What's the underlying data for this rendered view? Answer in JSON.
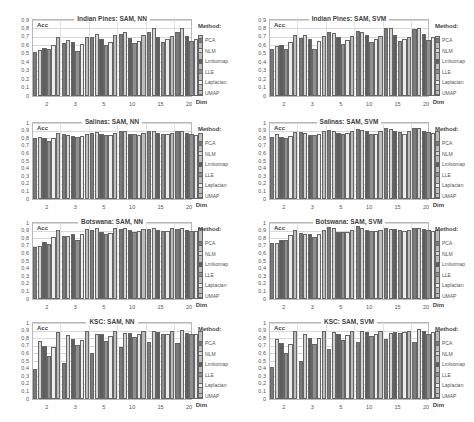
{
  "chart_data": [
    {
      "type": "bar",
      "title": "Indian Pines: SAM, NN",
      "ylabel": "Acc",
      "xlabel": "Dim",
      "ylim": [
        0,
        0.9
      ],
      "yticks": [
        "0",
        "0,1",
        "0,2",
        "0,3",
        "0,4",
        "0,5",
        "0,6",
        "0,7",
        "0,8",
        "0,9"
      ],
      "categories": [
        "2",
        "3",
        "5",
        "10",
        "15",
        "20"
      ],
      "legend_title": "Method:",
      "series": [
        {
          "name": "PCA",
          "values": [
            0.52,
            0.63,
            0.7,
            0.74,
            0.76,
            0.76
          ]
        },
        {
          "name": "NLM",
          "values": [
            0.54,
            0.66,
            0.73,
            0.76,
            0.8,
            0.8
          ]
        },
        {
          "name": "Lmlsomap",
          "values": [
            0.57,
            0.64,
            0.67,
            0.69,
            0.7,
            0.71
          ]
        },
        {
          "name": "LLE",
          "values": [
            0.56,
            0.53,
            0.6,
            0.63,
            0.64,
            0.65
          ]
        },
        {
          "name": "Laplacian",
          "values": [
            0.61,
            0.62,
            0.64,
            0.65,
            0.68,
            0.68
          ]
        },
        {
          "name": "UMAP",
          "values": [
            0.7,
            0.7,
            0.72,
            0.72,
            0.71,
            0.72
          ]
        }
      ]
    },
    {
      "type": "bar",
      "title": "Indian Pines: SAM, SVM",
      "ylabel": "Acc",
      "xlabel": "Dim",
      "ylim": [
        0,
        0.9
      ],
      "yticks": [
        "0",
        "0,1",
        "0,2",
        "0,3",
        "0,4",
        "0,5",
        "0,6",
        "0,7",
        "0,8",
        "0,9"
      ],
      "categories": [
        "2",
        "3",
        "5",
        "10",
        "15",
        "20"
      ],
      "legend_title": "Method:",
      "series": [
        {
          "name": "PCA",
          "values": [
            0.56,
            0.69,
            0.76,
            0.77,
            0.8,
            0.79
          ]
        },
        {
          "name": "NLM",
          "values": [
            0.59,
            0.72,
            0.75,
            0.76,
            0.8,
            0.8
          ]
        },
        {
          "name": "Lmlsomap",
          "values": [
            0.61,
            0.68,
            0.7,
            0.72,
            0.72,
            0.74
          ]
        },
        {
          "name": "LLE",
          "values": [
            0.56,
            0.56,
            0.62,
            0.64,
            0.65,
            0.66
          ]
        },
        {
          "name": "Laplacian",
          "values": [
            0.64,
            0.65,
            0.66,
            0.68,
            0.68,
            0.7
          ]
        },
        {
          "name": "UMAP",
          "values": [
            0.72,
            0.71,
            0.71,
            0.71,
            0.7,
            0.71
          ]
        }
      ]
    },
    {
      "type": "bar",
      "title": "Salinas: SAM, NN",
      "ylabel": "Acc",
      "xlabel": "Dim",
      "ylim": [
        0,
        1
      ],
      "yticks": [
        "0",
        "0,1",
        "0,2",
        "0,3",
        "0,4",
        "0,5",
        "0,6",
        "0,7",
        "0,8",
        "0,9",
        "1"
      ],
      "categories": [
        "2",
        "3",
        "5",
        "10",
        "15",
        "20"
      ],
      "legend_title": "Method:",
      "series": [
        {
          "name": "PCA",
          "values": [
            0.8,
            0.85,
            0.87,
            0.89,
            0.89,
            0.89
          ]
        },
        {
          "name": "NLM",
          "values": [
            0.82,
            0.84,
            0.88,
            0.9,
            0.9,
            0.9
          ]
        },
        {
          "name": "Lmlsomap",
          "values": [
            0.8,
            0.83,
            0.85,
            0.86,
            0.87,
            0.87
          ]
        },
        {
          "name": "LLE",
          "values": [
            0.76,
            0.82,
            0.84,
            0.85,
            0.86,
            0.86
          ]
        },
        {
          "name": "Laplacian",
          "values": [
            0.8,
            0.83,
            0.84,
            0.84,
            0.85,
            0.84
          ]
        },
        {
          "name": "UMAP",
          "values": [
            0.87,
            0.86,
            0.87,
            0.87,
            0.87,
            0.87
          ]
        }
      ]
    },
    {
      "type": "bar",
      "title": "Salinas: SAM, SVM",
      "ylabel": "Acc",
      "xlabel": "Dim",
      "ylim": [
        0,
        1
      ],
      "yticks": [
        "0",
        "0,1",
        "0,2",
        "0,3",
        "0,4",
        "0,5",
        "0,6",
        "0,7",
        "0,8",
        "0,9",
        "1"
      ],
      "categories": [
        "2",
        "3",
        "5",
        "10",
        "15",
        "20"
      ],
      "legend_title": "Method:",
      "series": [
        {
          "name": "PCA",
          "values": [
            0.82,
            0.88,
            0.91,
            0.92,
            0.93,
            0.94
          ]
        },
        {
          "name": "NLM",
          "values": [
            0.85,
            0.87,
            0.9,
            0.91,
            0.92,
            0.93
          ]
        },
        {
          "name": "Lmlsomap",
          "values": [
            0.82,
            0.84,
            0.87,
            0.89,
            0.9,
            0.9
          ]
        },
        {
          "name": "LLE",
          "values": [
            0.8,
            0.84,
            0.85,
            0.86,
            0.88,
            0.88
          ]
        },
        {
          "name": "Laplacian",
          "values": [
            0.83,
            0.86,
            0.87,
            0.86,
            0.86,
            0.87
          ]
        },
        {
          "name": "UMAP",
          "values": [
            0.88,
            0.89,
            0.89,
            0.89,
            0.89,
            0.89
          ]
        }
      ]
    },
    {
      "type": "bar",
      "title": "Botswana: SAM, NN",
      "ylabel": "Acc",
      "xlabel": "Dim",
      "ylim": [
        0,
        1
      ],
      "yticks": [
        "0",
        "0,1",
        "0,2",
        "0,3",
        "0,4",
        "0,5",
        "0,6",
        "0,7",
        "0,8",
        "0,9",
        "1"
      ],
      "categories": [
        "2",
        "3",
        "5",
        "10",
        "15",
        "20"
      ],
      "legend_title": "Method:",
      "series": [
        {
          "name": "PCA",
          "values": [
            0.68,
            0.83,
            0.91,
            0.92,
            0.92,
            0.92
          ]
        },
        {
          "name": "NLM",
          "values": [
            0.7,
            0.83,
            0.94,
            0.94,
            0.94,
            0.94
          ]
        },
        {
          "name": "Lmlsomap",
          "values": [
            0.75,
            0.85,
            0.88,
            0.91,
            0.91,
            0.91
          ]
        },
        {
          "name": "LLE",
          "values": [
            0.73,
            0.78,
            0.86,
            0.88,
            0.89,
            0.9
          ]
        },
        {
          "name": "Laplacian",
          "values": [
            0.82,
            0.85,
            0.87,
            0.9,
            0.9,
            0.9
          ]
        },
        {
          "name": "UMAP",
          "values": [
            0.91,
            0.92,
            0.93,
            0.92,
            0.93,
            0.93
          ]
        }
      ]
    },
    {
      "type": "bar",
      "title": "Botswana: SAM, SVM",
      "ylabel": "Acc",
      "xlabel": "Dim",
      "ylim": [
        0,
        1
      ],
      "yticks": [
        "0",
        "0,1",
        "0,2",
        "0,3",
        "0,4",
        "0,5",
        "0,6",
        "0,7",
        "0,8",
        "0,9",
        "1"
      ],
      "categories": [
        "2",
        "3",
        "5",
        "10",
        "15",
        "20"
      ],
      "legend_title": "Method:",
      "series": [
        {
          "name": "PCA",
          "values": [
            0.74,
            0.87,
            0.95,
            0.96,
            0.94,
            0.93
          ]
        },
        {
          "name": "NLM",
          "values": [
            0.74,
            0.85,
            0.94,
            0.93,
            0.92,
            0.93
          ]
        },
        {
          "name": "Lmlsomap",
          "values": [
            0.77,
            0.86,
            0.88,
            0.91,
            0.92,
            0.92
          ]
        },
        {
          "name": "LLE",
          "values": [
            0.77,
            0.81,
            0.88,
            0.9,
            0.91,
            0.91
          ]
        },
        {
          "name": "Laplacian",
          "values": [
            0.84,
            0.86,
            0.88,
            0.9,
            0.9,
            0.9
          ]
        },
        {
          "name": "UMAP",
          "values": [
            0.91,
            0.91,
            0.91,
            0.91,
            0.91,
            0.91
          ]
        }
      ]
    },
    {
      "type": "bar",
      "title": "KSC: SAM, NN",
      "ylabel": "Acc",
      "xlabel": "Dim",
      "ylim": [
        0,
        1
      ],
      "yticks": [
        "0",
        "0,1",
        "0,2",
        "0,3",
        "0,4",
        "0,5",
        "0,6",
        "0,7",
        "0,8",
        "0,9",
        "1"
      ],
      "categories": [
        "2",
        "3",
        "5",
        "10",
        "15",
        "20"
      ],
      "legend_title": "Method:",
      "series": [
        {
          "name": "PCA",
          "values": [
            0.39,
            0.47,
            0.6,
            0.68,
            0.75,
            0.74
          ]
        },
        {
          "name": "NLM",
          "values": [
            0.76,
            0.84,
            0.86,
            0.87,
            0.89,
            0.91
          ]
        },
        {
          "name": "Lmlsomap",
          "values": [
            0.7,
            0.79,
            0.85,
            0.87,
            0.88,
            0.87
          ]
        },
        {
          "name": "LLE",
          "values": [
            0.56,
            0.71,
            0.76,
            0.82,
            0.85,
            0.86
          ]
        },
        {
          "name": "Laplacian",
          "values": [
            0.69,
            0.77,
            0.83,
            0.85,
            0.86,
            0.86
          ]
        },
        {
          "name": "UMAP",
          "values": [
            0.88,
            0.89,
            0.89,
            0.89,
            0.89,
            0.9
          ]
        }
      ]
    },
    {
      "type": "bar",
      "title": "KSC: SAM, SVM",
      "ylabel": "Acc",
      "xlabel": "Dim",
      "ylim": [
        0,
        1
      ],
      "yticks": [
        "0",
        "0,1",
        "0,2",
        "0,3",
        "0,4",
        "0,5",
        "0,6",
        "0,7",
        "0,8",
        "0,9",
        "1"
      ],
      "categories": [
        "2",
        "3",
        "5",
        "10",
        "15",
        "20"
      ],
      "legend_title": "Method:",
      "series": [
        {
          "name": "PCA",
          "values": [
            0.42,
            0.5,
            0.66,
            0.75,
            0.79,
            0.75
          ]
        },
        {
          "name": "NLM",
          "values": [
            0.79,
            0.85,
            0.88,
            0.89,
            0.87,
            0.92
          ]
        },
        {
          "name": "Lmlsomap",
          "values": [
            0.74,
            0.8,
            0.86,
            0.88,
            0.88,
            0.9
          ]
        },
        {
          "name": "LLE",
          "values": [
            0.6,
            0.73,
            0.78,
            0.83,
            0.87,
            0.86
          ]
        },
        {
          "name": "Laplacian",
          "values": [
            0.72,
            0.8,
            0.84,
            0.86,
            0.88,
            0.88
          ]
        },
        {
          "name": "UMAP",
          "values": [
            0.89,
            0.89,
            0.89,
            0.89,
            0.89,
            0.9
          ]
        }
      ]
    }
  ]
}
